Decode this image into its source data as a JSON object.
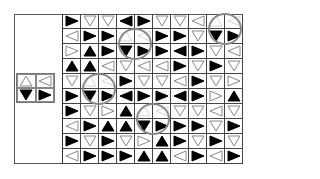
{
  "puzzle": {
    "type": "triangle-pattern-search",
    "rows": 10,
    "cols": 10,
    "legend": {
      "U": "white-up-triangle",
      "D": "white-down-triangle",
      "L": "white-left-triangle",
      "R": "white-right-triangle",
      "u": "black-up-triangle",
      "d": "black-down-triangle",
      "l": "black-left-triangle",
      "r": "black-right-triangle"
    },
    "key_pattern": [
      [
        "U",
        "L"
      ],
      [
        "d",
        "r"
      ]
    ],
    "grid": [
      [
        "r",
        "D",
        "D",
        "l",
        "r",
        "D",
        "D",
        "L",
        "U",
        "L"
      ],
      [
        "L",
        "r",
        "r",
        "U",
        "L",
        "r",
        "r",
        "D",
        "d",
        "r"
      ],
      [
        "R",
        "u",
        "r",
        "d",
        "r",
        "r",
        "l",
        "r",
        "D",
        "L"
      ],
      [
        "u",
        "u",
        "L",
        "D",
        "L",
        "L",
        "r",
        "D",
        "r",
        "D"
      ],
      [
        "D",
        "U",
        "L",
        "r",
        "D",
        "D",
        "L",
        "r",
        "D",
        "R"
      ],
      [
        "r",
        "d",
        "r",
        "l",
        "r",
        "r",
        "l",
        "r",
        "R",
        "u"
      ],
      [
        "r",
        "D",
        "R",
        "u",
        "U",
        "L",
        "D",
        "D",
        "L",
        "D"
      ],
      [
        "L",
        "r",
        "u",
        "u",
        "d",
        "r",
        "r",
        "r",
        "D",
        "r"
      ],
      [
        "r",
        "D",
        "r",
        "D",
        "R",
        "u",
        "r",
        "D",
        "r",
        "D"
      ],
      [
        "L",
        "r",
        "r",
        "r",
        "u",
        "u",
        "L",
        "r",
        "L",
        "r"
      ]
    ],
    "matches": [
      {
        "row": 0,
        "col": 8
      },
      {
        "row": 1,
        "col": 3
      },
      {
        "row": 4,
        "col": 1
      },
      {
        "row": 6,
        "col": 4
      }
    ],
    "colors": {
      "frame": "#555555",
      "circle": "#888888",
      "fill": "#000000",
      "outline": "#888888"
    }
  }
}
